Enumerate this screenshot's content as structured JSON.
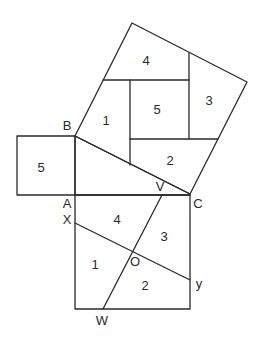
{
  "diagram": {
    "title": "",
    "points": {
      "A": "A",
      "B": "B",
      "C": "C",
      "V": "V",
      "X": "X",
      "Y": "y",
      "W": "W",
      "O": "O"
    },
    "hypotenuse_square_pieces": [
      "4",
      "1",
      "5",
      "3",
      "2"
    ],
    "small_square_piece": "5",
    "large_square_pieces": [
      "4",
      "3",
      "1",
      "2"
    ]
  }
}
